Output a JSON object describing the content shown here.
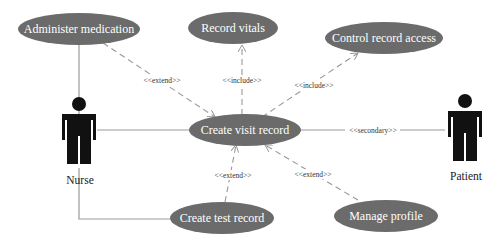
{
  "diagram": {
    "type": "UML use case diagram",
    "colors": {
      "use_case_fill": "#6b6b6b",
      "use_case_text": "#ffffff",
      "line": "#999999",
      "actor": "#111111",
      "label": "#333333"
    },
    "actors": [
      {
        "id": "nurse",
        "label": "Nurse"
      },
      {
        "id": "patient",
        "label": "Patient"
      }
    ],
    "use_cases": [
      {
        "id": "administer",
        "label": "Administer medication"
      },
      {
        "id": "vitals",
        "label": "Record vitals"
      },
      {
        "id": "access",
        "label": "Control record access"
      },
      {
        "id": "visit",
        "label": "Create visit record"
      },
      {
        "id": "test",
        "label": "Create test record"
      },
      {
        "id": "profile",
        "label": "Manage profile"
      }
    ],
    "relationships": [
      {
        "from": "nurse",
        "to": "administer",
        "type": "association",
        "label": ""
      },
      {
        "from": "nurse",
        "to": "visit",
        "type": "association",
        "label": ""
      },
      {
        "from": "nurse",
        "to": "test",
        "type": "association",
        "label": ""
      },
      {
        "from": "visit",
        "to": "patient",
        "type": "association",
        "label": "<<secondary>>"
      },
      {
        "from": "administer",
        "to": "visit",
        "type": "dependency",
        "label": "<<extend>>"
      },
      {
        "from": "visit",
        "to": "vitals",
        "type": "dependency",
        "label": "<<include>>"
      },
      {
        "from": "visit",
        "to": "access",
        "type": "dependency",
        "label": "<<include>>"
      },
      {
        "from": "test",
        "to": "visit",
        "type": "dependency",
        "label": "<<extend>>"
      },
      {
        "from": "profile",
        "to": "visit",
        "type": "dependency",
        "label": "<<extend>>"
      }
    ]
  }
}
